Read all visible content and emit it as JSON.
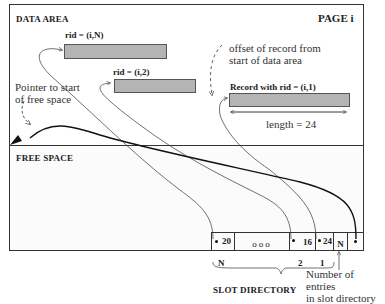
{
  "page": {
    "title": "PAGE i",
    "data_area_label": "DATA AREA",
    "free_space_label": "FREE SPACE"
  },
  "records": [
    {
      "label": "rid = (i,N)"
    },
    {
      "label": "rid = (i,2)"
    },
    {
      "label": "Record with rid = (i,1)"
    }
  ],
  "annotations": {
    "offset_line1": "offset of record from",
    "offset_line2": "start of data area",
    "pointer_line1": "Pointer to start",
    "pointer_line2": "of free space",
    "length": "length = 24",
    "entries_line1": "Number of entries",
    "entries_line2": "in slot directory",
    "slot_directory": "SLOT DIRECTORY"
  },
  "slot_directory": {
    "slots": [
      {
        "offset": "20",
        "index_label": "N"
      },
      {
        "offset": "ooo",
        "index_label": ""
      },
      {
        "offset": "16",
        "index_label": "2"
      },
      {
        "offset": "24",
        "index_label": "1"
      }
    ],
    "count": "N",
    "free_ptr": "•"
  },
  "colors": {
    "record_fill": "#b4b4b4",
    "border": "#333333",
    "free_space_bg": "#fbfbfb"
  }
}
